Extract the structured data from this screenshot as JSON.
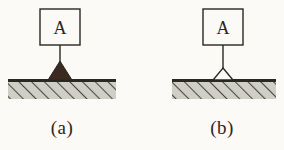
{
  "figure": {
    "type": "mechanics-support-diagram",
    "background_color": "#fbfaf6",
    "ink_color": "#2b2722",
    "ground_fill_color": "#cfcfc6",
    "hatch_color": "#4a463f",
    "panels": [
      {
        "id": "panel-a",
        "caption": "(a)",
        "block_label": "A",
        "support_type": "knife-edge-support",
        "support_filled": true,
        "support_fill_color": "#3a2a20"
      },
      {
        "id": "panel-b",
        "caption": "(b)",
        "block_label": "A",
        "support_type": "pin-support",
        "support_filled": false,
        "support_fill_color": "#fbfaf6"
      }
    ]
  },
  "geometry": {
    "panel_a": {
      "box": {
        "x": 40,
        "y": 9,
        "w": 40,
        "h": 36
      },
      "letter": {
        "x": 60,
        "y": 33
      },
      "rod": {
        "x": 60,
        "y1": 45,
        "y2": 72
      },
      "triangle": {
        "cx": 60,
        "apex_y": 61,
        "base_y": 80,
        "half_w": 12
      },
      "ground": {
        "x1": 8,
        "x2": 116,
        "y": 80,
        "depth": 19
      }
    },
    "panel_b": {
      "box": {
        "x": 203,
        "y": 9,
        "w": 40,
        "h": 36
      },
      "letter": {
        "x": 223,
        "y": 33
      },
      "rod": {
        "x": 223,
        "y1": 45,
        "y2": 70
      },
      "triangle": {
        "cx": 223,
        "apex_y": 68,
        "base_y": 80,
        "half_w": 10
      },
      "ground": {
        "x1": 172,
        "x2": 276,
        "y": 80,
        "depth": 19
      }
    }
  }
}
